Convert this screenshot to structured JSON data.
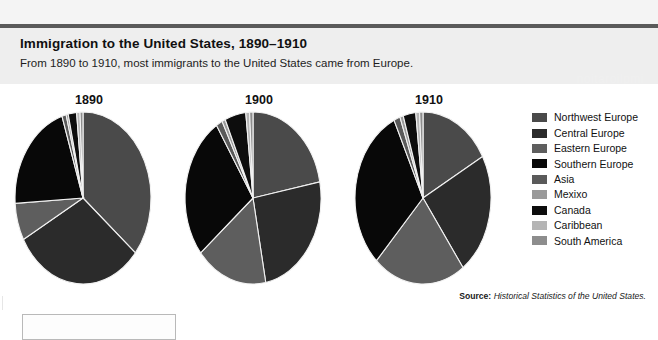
{
  "header": {
    "title": "Immigration to the United States, 1890–1910",
    "subtitle": "From 1890 to 1910, most immigrants to the United States came from Europe.",
    "watermark": "noitaroilpmi"
  },
  "source": {
    "label": "Source:",
    "text": "Historical Statistics of the United States."
  },
  "legend": {
    "items": [
      {
        "label": "Northwest Europe",
        "color": "#4a4a4a"
      },
      {
        "label": "Central Europe",
        "color": "#2b2b2b"
      },
      {
        "label": "Eastern Europe",
        "color": "#5e5e5e"
      },
      {
        "label": "Southern Europe",
        "color": "#080808"
      },
      {
        "label": "Asia",
        "color": "#5a5a5a"
      },
      {
        "label": "Mexixo",
        "color": "#9a9a9a"
      },
      {
        "label": "Canada",
        "color": "#0d0d0d"
      },
      {
        "label": "Caribbean",
        "color": "#b5b5b5"
      },
      {
        "label": "South America",
        "color": "#8d8d8d"
      }
    ]
  },
  "chart_data": {
    "type": "pie",
    "title": "Immigration to the United States, 1890–1910",
    "subtitle": "From 1890 to 1910, most immigrants to the United States came from Europe.",
    "categories": [
      "Northwest Europe",
      "Central Europe",
      "Eastern Europe",
      "Southern Europe",
      "Asia",
      "Mexixo",
      "Canada",
      "Caribbean",
      "South America"
    ],
    "colors": [
      "#4a4a4a",
      "#2b2b2b",
      "#5e5e5e",
      "#080808",
      "#5a5a5a",
      "#9a9a9a",
      "#0d0d0d",
      "#b5b5b5",
      "#8d8d8d"
    ],
    "units": "percent of total immigrants",
    "legend_position": "right",
    "charts": [
      {
        "name": "1890",
        "label": "1890",
        "center": [
          82,
          196
        ],
        "radius": 71,
        "values": [
          36,
          31,
          7,
          21,
          1,
          0.5,
          2,
          0.8,
          0.7
        ]
      },
      {
        "name": "1900",
        "label": "1900",
        "center": [
          252,
          196
        ],
        "radius": 71,
        "values": [
          22,
          25,
          17,
          27,
          1.5,
          0.8,
          5,
          0.9,
          0.8
        ]
      },
      {
        "name": "1910",
        "label": "1910",
        "center": [
          422,
          196
        ],
        "radius": 71,
        "values": [
          17,
          23,
          22,
          31,
          1.5,
          0.8,
          3,
          0.9,
          0.8
        ]
      }
    ]
  }
}
